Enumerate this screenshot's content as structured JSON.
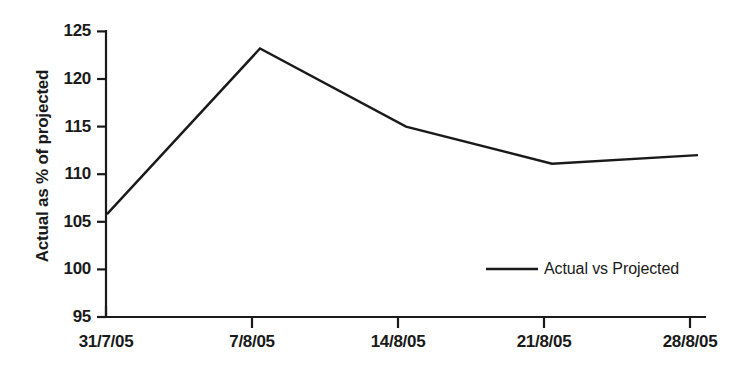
{
  "chart_data": {
    "type": "line",
    "title": "",
    "xlabel": "",
    "ylabel": "Actual as % of projected",
    "categories": [
      "31/7/05",
      "7/8/05",
      "14/8/05",
      "21/8/05",
      "28/8/05"
    ],
    "series": [
      {
        "name": "Actual vs Projected",
        "values": [
          105.8,
          123.2,
          115.0,
          111.1,
          112.0
        ],
        "color": "#1a1a1a"
      }
    ],
    "ylim": [
      95,
      125
    ],
    "yticks": [
      95,
      100,
      105,
      110,
      115,
      120,
      125
    ],
    "ytick_labels": [
      "95",
      "100",
      "105",
      "110",
      "115",
      "120",
      "125"
    ],
    "grid": false,
    "legend_position": "inside-lower-right",
    "legend": [
      {
        "label": "Actual vs Projected",
        "marker": "line"
      }
    ]
  },
  "axes": {
    "y_axis_label": "Actual as % of projected"
  },
  "legend": {
    "entry_label": "Actual vs Projected"
  }
}
